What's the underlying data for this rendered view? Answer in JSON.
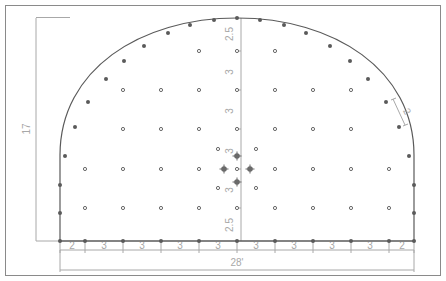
{
  "diagram": {
    "type": "tunnel-blast-hole-pattern",
    "colors": {
      "frame": "#8a8a8a",
      "profile": "#5a5a5a",
      "dimension": "#a8a8a8",
      "hole": "#6a6a6a",
      "background": "#ffffff"
    },
    "dimensions": {
      "width_label": "28'",
      "height_label": "17",
      "perimeter_spacing_label": "2",
      "vertical_spacings": [
        "2.5",
        "3",
        "3",
        "3",
        "3",
        "2.5"
      ],
      "floor_spacings": [
        "2",
        "3",
        "3",
        "3",
        "3",
        "3",
        "3",
        "3",
        "3",
        "2"
      ]
    },
    "profile": {
      "shape": "horseshoe",
      "description": "Arched crown over vertical side walls on a flat floor"
    },
    "holes": {
      "perimeter_count": 29,
      "floor_count": 11,
      "interior_grid_rows": 5,
      "cut_holes": {
        "large_relief_holes": 4,
        "small_holes": 4
      }
    }
  }
}
